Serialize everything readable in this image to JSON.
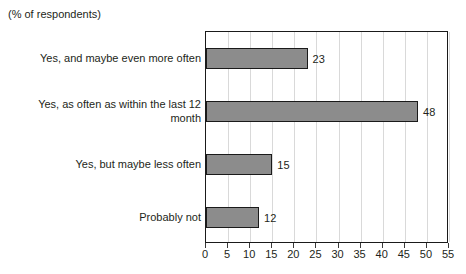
{
  "header": {
    "note": "(% of respondents)"
  },
  "chart_data": {
    "type": "bar",
    "orientation": "horizontal",
    "title": "",
    "subtitle": "(% of respondents)",
    "xlabel": "",
    "ylabel": "",
    "categories": [
      "Yes, and maybe even more often",
      "Yes, as often as within the last 12 month",
      "Yes, but maybe less often",
      "Probably not"
    ],
    "values": [
      23,
      48,
      15,
      12
    ],
    "value_labels": [
      "23",
      "48",
      "15",
      "12"
    ],
    "xlim": [
      0,
      55
    ],
    "xticks": [
      0,
      5,
      10,
      15,
      20,
      25,
      30,
      35,
      40,
      45,
      50,
      55
    ],
    "xtick_labels": [
      "0",
      "5",
      "10",
      "15",
      "20",
      "25",
      "30",
      "35",
      "40",
      "45",
      "50",
      "55"
    ],
    "grid": "vertical",
    "legend": "none",
    "bar_color": "#8c8c8c",
    "bar_border_color": "#1a1a1a",
    "gridline_color": "#d9d9d9",
    "frame_color": "#1a1a1a",
    "text_color": "#231f20"
  }
}
